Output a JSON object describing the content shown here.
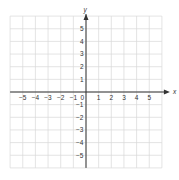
{
  "diagram": {
    "type": "coordinate-plane",
    "axes": {
      "x_label": "x",
      "y_label": "y",
      "x_range": [
        -6,
        6
      ],
      "y_range": [
        -6,
        6
      ],
      "x_ticks": [
        "-5",
        "-4",
        "-3",
        "-2",
        "-1",
        "0",
        "1",
        "2",
        "3",
        "4",
        "5"
      ],
      "y_ticks_positive": [
        "5",
        "4",
        "3",
        "2",
        "1"
      ],
      "y_ticks_negative": [
        "-1",
        "-2",
        "-3",
        "-4",
        "-5"
      ],
      "origin_label": "0"
    },
    "grid": {
      "on": true,
      "step": 1
    },
    "colors": {
      "grid": "#d9d9d9",
      "axis": "#333333",
      "label": "#333333",
      "background": "#ffffff"
    }
  }
}
